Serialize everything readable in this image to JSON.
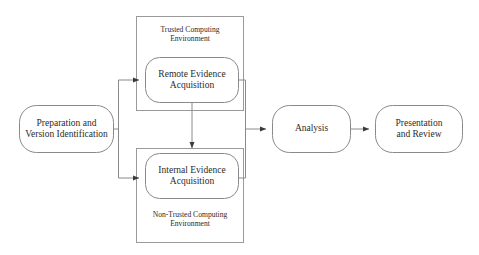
{
  "diagram": {
    "background_color": "#ffffff",
    "stroke_color": "#8a8a8a",
    "text_color": "#2b2b2b",
    "nodes": {
      "preparation": {
        "label": "Preparation and\nVersion Identification"
      },
      "remote_evidence": {
        "label": "Remote Evidence\nAcquisition"
      },
      "internal_evidence": {
        "label": "Internal Evidence\nAcquisition"
      },
      "analysis": {
        "label": "Analysis"
      },
      "presentation": {
        "label": "Presentation\nand Review"
      }
    },
    "groups": {
      "trusted": {
        "caption": "Trusted Computing\nEnvironment"
      },
      "non_trusted": {
        "caption": "Non-Trusted Computing\nEnvironment"
      }
    }
  }
}
